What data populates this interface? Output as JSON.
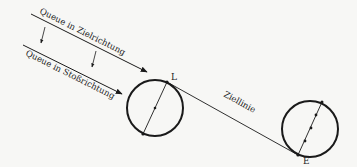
{
  "diagram": {
    "labels": {
      "queue_target": "Queue in Zielrichtung",
      "queue_shot": "Queue in Stoßrichtung",
      "target_line": "Ziellinie",
      "point_l": "L",
      "point_e": "E"
    },
    "colors": {
      "background": "#f7f7f5",
      "stroke": "#1a1a1a"
    }
  }
}
